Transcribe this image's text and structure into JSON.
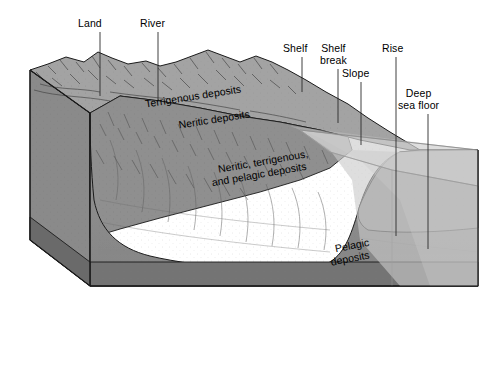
{
  "figure": {
    "type": "block-diagram",
    "background_color": "#ffffff"
  },
  "colors": {
    "land_surface": "#a0a0a0",
    "front_face": "#8d8d8d",
    "left_face": "#8a8a8a",
    "slope_face": "#7d7d7d",
    "basement_band": "#6e6e6e",
    "water_overlay": "#c9c9c9",
    "seafloor_plane": "#b4b4b4",
    "outline": "#1a1a1a",
    "label_text": "#000000",
    "leader_line": "#2a2a2a"
  },
  "callouts": [
    {
      "id": "land",
      "label": "Land",
      "x": 78,
      "y": 18,
      "leader_x": 100,
      "leader_y1": 32,
      "leader_y2": 96
    },
    {
      "id": "river",
      "label": "River",
      "x": 140,
      "y": 18,
      "leader_x": 158,
      "leader_y1": 32,
      "leader_y2": 101
    },
    {
      "id": "shelf",
      "label": "Shelf",
      "x": 283,
      "y": 43,
      "leader_x": 302,
      "leader_y1": 57,
      "leader_y2": 92
    },
    {
      "id": "shelf-break",
      "label": "Shelf\nbreak",
      "x": 320,
      "y": 43,
      "leader_x": 338,
      "leader_y1": 69,
      "leader_y2": 123
    },
    {
      "id": "slope",
      "label": "Slope",
      "x": 342,
      "y": 68,
      "leader_x": 361,
      "leader_y1": 82,
      "leader_y2": 145
    },
    {
      "id": "rise",
      "label": "Rise",
      "x": 382,
      "y": 43,
      "leader_x": 396,
      "leader_y1": 57,
      "leader_y2": 236
    },
    {
      "id": "deep-sea-floor",
      "label": "Deep\nsea floor",
      "x": 398,
      "y": 88,
      "leader_x": 428,
      "leader_y1": 114,
      "leader_y2": 249
    }
  ],
  "surface_labels": [
    {
      "id": "terrigenous-deposits",
      "label": "Terrigenous deposits",
      "x": 193,
      "y": 96,
      "rotate": -9
    },
    {
      "id": "neritic-deposits",
      "label": "Neritic deposits",
      "x": 214,
      "y": 119,
      "rotate": -9
    },
    {
      "id": "mixed-deposits-line1",
      "label": "Neritic, terrigenous,",
      "x": 263,
      "y": 161,
      "rotate": -10
    },
    {
      "id": "mixed-deposits-line2",
      "label": "and pelagic deposits",
      "x": 259,
      "y": 174,
      "rotate": -10
    },
    {
      "id": "pelagic-deposits-line1",
      "label": "Pelagic",
      "x": 352,
      "y": 245,
      "rotate": -11
    },
    {
      "id": "pelagic-deposits-line2",
      "label": "deposits",
      "x": 350,
      "y": 258,
      "rotate": -11
    }
  ]
}
